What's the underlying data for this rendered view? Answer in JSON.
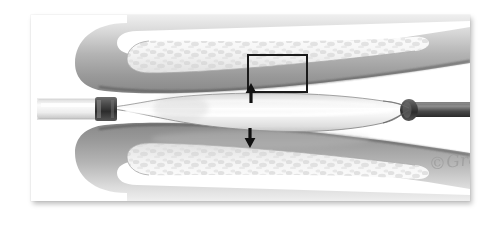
{
  "figure": {
    "type": "medical-illustration",
    "style": "grayscale airbrush rendering",
    "signature": "©Gralapp",
    "background_color": "#ffffff",
    "panel_background": "#ffffff",
    "panel_shadow_color": "#000000"
  },
  "canvas": {
    "width": 500,
    "height": 231,
    "panel": {
      "left": 31,
      "top": 15,
      "width": 439,
      "height": 186
    }
  },
  "annotations": {
    "callout_rect": {
      "label": "detail-region",
      "left": 216,
      "top": 39,
      "width": 61,
      "height": 39,
      "stroke_color": "#1a1a1a",
      "stroke_width": 2
    },
    "arrows": [
      {
        "name": "expansion-arrow-up",
        "direction": "up",
        "meaning": "outward radial expansion against upper vessel wall",
        "x": 246,
        "y": 82,
        "length": 19,
        "color": "#111111"
      },
      {
        "name": "expansion-arrow-down",
        "direction": "down",
        "meaning": "outward radial expansion against lower vessel wall",
        "x": 245,
        "y": 127,
        "length": 19,
        "color": "#111111"
      }
    ]
  },
  "anatomy": {
    "vessel_wall": {
      "name": "vessel-wall",
      "fill_light": "#e9e9e9",
      "fill_mid": "#b9b9b9",
      "fill_dark": "#8f8f8f",
      "outline": "#5a5a5a"
    },
    "plaque_layer": {
      "name": "plaque-intima-layer",
      "fill": "#f6f6f6",
      "speckle": "#d6d6d6",
      "outline": "#9b9b9b"
    },
    "lumen": {
      "name": "vessel-lumen",
      "fill": "#fdfdfd"
    }
  },
  "device": {
    "balloon": {
      "name": "angioplasty-balloon",
      "fill_light": "#f2f2f2",
      "fill_mid": "#d8d8d8",
      "highlight": "#ffffff",
      "outline": "#8a8a8a"
    },
    "catheter_shaft_left": {
      "name": "catheter-shaft-proximal",
      "fill_light": "#fbfbfb",
      "fill_mid": "#d4d4d4",
      "outline": "#9d9d9d"
    },
    "catheter_shaft_right": {
      "name": "guidewire-shaft-distal",
      "fill_light": "#8d8d8d",
      "fill_mid": "#4a4a4a",
      "fill_dark": "#2f2f2f"
    },
    "marker_bands": [
      {
        "name": "marker-band-proximal",
        "x": 101,
        "y": 110,
        "color": "#3a3a3a"
      },
      {
        "name": "marker-band-distal",
        "x": 408,
        "y": 110,
        "color": "#3a3a3a"
      }
    ]
  }
}
